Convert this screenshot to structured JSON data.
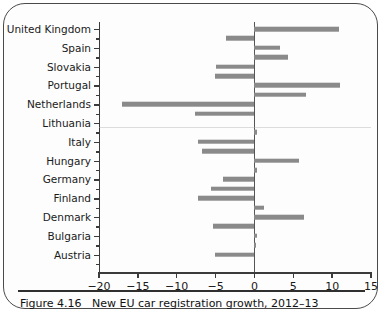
{
  "figure": {
    "caption_number": "Figure 4.16",
    "caption_text": "New EU car registration growth, 2012–13"
  },
  "chart_data": {
    "type": "bar",
    "orientation": "horizontal",
    "title": "New EU car registration growth, 2012–13",
    "xlabel": "",
    "ylabel": "",
    "xlim": [
      -20,
      15
    ],
    "xticks": [
      -20,
      -15,
      -10,
      -5,
      0,
      5,
      10,
      15
    ],
    "xticklabels": [
      "−20",
      "−15",
      "−10",
      "−5",
      "0",
      "5",
      "10",
      "15"
    ],
    "grid": false,
    "legend": false,
    "bar_color": "#8a8a8a",
    "axis_color": "#3b3b3b",
    "categories": [
      "United Kingdom",
      "Spain",
      "Slovakia",
      "Portugal",
      "Netherlands",
      "Lithuania",
      "Italy",
      "Hungary",
      "Germany",
      "Finland",
      "Denmark",
      "Bulgaria",
      "Austria"
    ],
    "bars": [
      {
        "label": "United Kingdom",
        "value": 10.9,
        "labelled": true
      },
      {
        "label": "",
        "value": -3.7,
        "labelled": false
      },
      {
        "label": "Spain",
        "value": 3.3,
        "labelled": true
      },
      {
        "label": "",
        "value": 4.3,
        "labelled": false
      },
      {
        "label": "Slovakia",
        "value": -4.9,
        "labelled": true
      },
      {
        "label": "",
        "value": -5.1,
        "labelled": false
      },
      {
        "label": "Portugal",
        "value": 11.0,
        "labelled": true
      },
      {
        "label": "",
        "value": 6.6,
        "labelled": false
      },
      {
        "label": "Netherlands",
        "value": -17.0,
        "labelled": true
      },
      {
        "label": "",
        "value": -7.7,
        "labelled": false
      },
      {
        "label": "Lithuania",
        "value": 0.0,
        "labelled": true
      },
      {
        "label": "",
        "value": 0.3,
        "labelled": false
      },
      {
        "label": "Italy",
        "value": -7.2,
        "labelled": true
      },
      {
        "label": "",
        "value": -6.8,
        "labelled": false
      },
      {
        "label": "Hungary",
        "value": 5.7,
        "labelled": true
      },
      {
        "label": "",
        "value": 0.3,
        "labelled": false
      },
      {
        "label": "Germany",
        "value": -4.1,
        "labelled": true
      },
      {
        "label": "",
        "value": -5.6,
        "labelled": false
      },
      {
        "label": "Finland",
        "value": -7.2,
        "labelled": true
      },
      {
        "label": "",
        "value": 1.2,
        "labelled": false
      },
      {
        "label": "Denmark",
        "value": 6.4,
        "labelled": true
      },
      {
        "label": "",
        "value": -5.3,
        "labelled": false
      },
      {
        "label": "Bulgaria",
        "value": 0.3,
        "labelled": true
      },
      {
        "label": "",
        "value": 0.1,
        "labelled": false
      },
      {
        "label": "Austria",
        "value": -5.1,
        "labelled": true
      },
      {
        "label": "",
        "value": 0.0,
        "labelled": false
      }
    ]
  }
}
